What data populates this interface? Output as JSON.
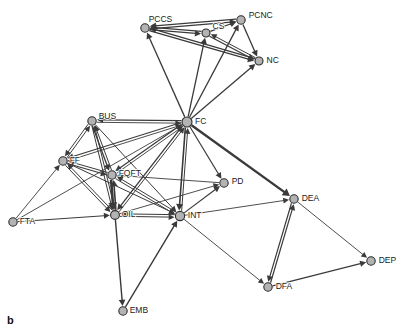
{
  "figure": {
    "panel_caption": "b",
    "type": "directed-network-graph",
    "background_color": "#ffffff",
    "node_fill_color": "#b3b3b3",
    "node_stroke_color": "#2b2b2b",
    "edge_color": "#3a3a3a",
    "width": 402,
    "height": 334
  },
  "chart_data": {
    "type": "scatter",
    "title": "",
    "xlabel": "",
    "ylabel": "",
    "graph_kind": "directed network diagram",
    "node_count": 16,
    "edge_count": 52,
    "nodes": [
      {
        "id": "PCCS",
        "label": "PCCS",
        "x": 145,
        "y": 28,
        "r": 4.2,
        "label_dx": 2,
        "label_dy": -6
      },
      {
        "id": "CS",
        "label": "CS",
        "x": 206,
        "y": 33,
        "r": 4.0,
        "label_dx": 5,
        "label_dy": -4
      },
      {
        "id": "PCNC",
        "label": "PCNC",
        "x": 241,
        "y": 20,
        "r": 4.2,
        "label_dx": 6,
        "label_dy": -2
      },
      {
        "id": "NC",
        "label": "NC",
        "x": 259,
        "y": 61,
        "r": 4.0,
        "label_dx": 6,
        "label_dy": 2
      },
      {
        "id": "FC",
        "label": "FC",
        "x": 187,
        "y": 122,
        "r": 5.0,
        "label_dx": 6,
        "label_dy": 2
      },
      {
        "id": "BUS",
        "label": "BUS",
        "x": 92,
        "y": 121,
        "r": 4.2,
        "label_dx": 5,
        "label_dy": -2
      },
      {
        "id": "FF",
        "label": "FF",
        "x": 63,
        "y": 161,
        "r": 4.2,
        "label_dx": 5,
        "label_dy": 2
      },
      {
        "id": "FQFT",
        "label": "FQFT",
        "x": 112,
        "y": 175,
        "r": 4.2,
        "label_dx": 5,
        "label_dy": 1
      },
      {
        "id": "PD",
        "label": "PD",
        "x": 224,
        "y": 183,
        "r": 4.2,
        "label_dx": 6,
        "label_dy": 1
      },
      {
        "id": "OIL",
        "label": "OIL",
        "x": 115,
        "y": 215,
        "r": 4.4,
        "label_dx": 5,
        "label_dy": 2
      },
      {
        "id": "INT",
        "label": "INT",
        "x": 180,
        "y": 216,
        "r": 4.6,
        "label_dx": 6,
        "label_dy": 2
      },
      {
        "id": "FTA",
        "label": "FTA",
        "x": 13,
        "y": 222,
        "r": 4.2,
        "label_dx": 5,
        "label_dy": 2
      },
      {
        "id": "DEA",
        "label": "DEA",
        "x": 294,
        "y": 199,
        "r": 4.2,
        "label_dx": 6,
        "label_dy": 2
      },
      {
        "id": "DEP",
        "label": "DEP",
        "x": 371,
        "y": 261,
        "r": 4.2,
        "label_dx": 6,
        "label_dy": 2
      },
      {
        "id": "DFA",
        "label": "DFA",
        "x": 268,
        "y": 287,
        "r": 4.2,
        "label_dx": 6,
        "label_dy": 2
      },
      {
        "id": "EMB",
        "label": "EMB",
        "x": 123,
        "y": 311,
        "r": 4.2,
        "label_dx": 5,
        "label_dy": 2
      }
    ],
    "edges": [
      {
        "from": "PCNC",
        "to": "PCCS",
        "w": 1.3
      },
      {
        "from": "CS",
        "to": "PCCS",
        "w": 1.3
      },
      {
        "from": "NC",
        "to": "PCCS",
        "w": 1.3
      },
      {
        "from": "PCCS",
        "to": "CS",
        "w": 1.3
      },
      {
        "from": "PCCS",
        "to": "PCNC",
        "w": 1.3
      },
      {
        "from": "PCCS",
        "to": "NC",
        "w": 1.3
      },
      {
        "from": "CS",
        "to": "PCNC",
        "w": 1.3
      },
      {
        "from": "CS",
        "to": "NC",
        "w": 1.3
      },
      {
        "from": "PCNC",
        "to": "NC",
        "w": 1.3
      },
      {
        "from": "NC",
        "to": "CS",
        "w": 1.0
      },
      {
        "from": "FC",
        "to": "PCCS",
        "w": 1.3
      },
      {
        "from": "FC",
        "to": "CS",
        "w": 1.3
      },
      {
        "from": "FC",
        "to": "PCNC",
        "w": 1.3
      },
      {
        "from": "FC",
        "to": "NC",
        "w": 1.3
      },
      {
        "from": "BUS",
        "to": "FC",
        "w": 0.9
      },
      {
        "from": "FC",
        "to": "BUS",
        "w": 1.2
      },
      {
        "from": "FF",
        "to": "FC",
        "w": 0.9
      },
      {
        "from": "FC",
        "to": "FF",
        "w": 1.1
      },
      {
        "from": "FQFT",
        "to": "FC",
        "w": 0.9
      },
      {
        "from": "FC",
        "to": "FQFT",
        "w": 1.2
      },
      {
        "from": "OIL",
        "to": "FC",
        "w": 1.0
      },
      {
        "from": "FC",
        "to": "OIL",
        "w": 1.3
      },
      {
        "from": "INT",
        "to": "FC",
        "w": 1.0
      },
      {
        "from": "FC",
        "to": "INT",
        "w": 1.6
      },
      {
        "from": "FC",
        "to": "PD",
        "w": 1.2
      },
      {
        "from": "FC",
        "to": "DEA",
        "w": 2.4
      },
      {
        "from": "FTA",
        "to": "FC",
        "w": 0.9
      },
      {
        "from": "BUS",
        "to": "FF",
        "w": 1.0
      },
      {
        "from": "FF",
        "to": "BUS",
        "w": 1.0
      },
      {
        "from": "BUS",
        "to": "FQFT",
        "w": 1.3
      },
      {
        "from": "FQFT",
        "to": "BUS",
        "w": 1.0
      },
      {
        "from": "BUS",
        "to": "OIL",
        "w": 1.0
      },
      {
        "from": "OIL",
        "to": "BUS",
        "w": 1.0
      },
      {
        "from": "BUS",
        "to": "INT",
        "w": 1.0
      },
      {
        "from": "FF",
        "to": "FQFT",
        "w": 1.2
      },
      {
        "from": "FQFT",
        "to": "FF",
        "w": 1.0
      },
      {
        "from": "FF",
        "to": "OIL",
        "w": 1.0
      },
      {
        "from": "OIL",
        "to": "FF",
        "w": 1.0
      },
      {
        "from": "FF",
        "to": "INT",
        "w": 1.0
      },
      {
        "from": "FQFT",
        "to": "OIL",
        "w": 2.6
      },
      {
        "from": "OIL",
        "to": "FQFT",
        "w": 1.6
      },
      {
        "from": "FQFT",
        "to": "INT",
        "w": 1.0
      },
      {
        "from": "INT",
        "to": "FQFT",
        "w": 1.0
      },
      {
        "from": "FTA",
        "to": "OIL",
        "w": 1.0
      },
      {
        "from": "FTA",
        "to": "FF",
        "w": 0.9
      },
      {
        "from": "OIL",
        "to": "INT",
        "w": 1.0
      },
      {
        "from": "INT",
        "to": "OIL",
        "w": 1.0
      },
      {
        "from": "OIL",
        "to": "PD",
        "w": 0.9
      },
      {
        "from": "INT",
        "to": "PD",
        "w": 1.2
      },
      {
        "from": "PD",
        "to": "FQFT",
        "w": 0.9
      },
      {
        "from": "OIL",
        "to": "EMB",
        "w": 1.4
      },
      {
        "from": "EMB",
        "to": "INT",
        "w": 1.4
      },
      {
        "from": "INT",
        "to": "DEA",
        "w": 0.9
      },
      {
        "from": "INT",
        "to": "DFA",
        "w": 0.9
      },
      {
        "from": "DFA",
        "to": "DEA",
        "w": 1.2
      },
      {
        "from": "DEA",
        "to": "DFA",
        "w": 1.2
      },
      {
        "from": "DEA",
        "to": "DEP",
        "w": 0.9
      },
      {
        "from": "DFA",
        "to": "DEP",
        "w": 1.2
      }
    ],
    "legend": [],
    "grid": false
  }
}
